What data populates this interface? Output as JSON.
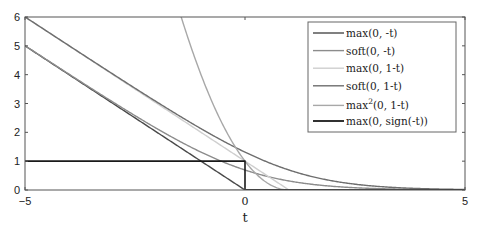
{
  "chart_data": {
    "type": "line",
    "title": "",
    "xlabel": "t",
    "ylabel": "",
    "xlim": [
      -5,
      5
    ],
    "ylim": [
      0,
      6
    ],
    "x_ticks": [
      -5,
      0,
      5
    ],
    "x_tick_labels": [
      "−5",
      "0",
      "5"
    ],
    "y_ticks": [
      0,
      1,
      2,
      3,
      4,
      5,
      6
    ],
    "y_tick_labels": [
      "0",
      "1",
      "2",
      "3",
      "4",
      "5",
      "6"
    ],
    "grid": false,
    "legend_position": "top-right",
    "series": [
      {
        "name": "max(0, -t)",
        "legend_base": "max",
        "legend_sup": "",
        "legend_args": "(0, -t)",
        "color": "#4a4a4a",
        "function": "max(0,-t)",
        "x": [
          -5,
          0,
          5
        ],
        "y": [
          5,
          0,
          0
        ]
      },
      {
        "name": "soft(0, -t)",
        "legend_base": "soft",
        "legend_sup": "",
        "legend_args": "(0, -t)",
        "color": "#8c8c8c",
        "function": "log(1+exp(-t))",
        "x": [
          -5,
          -2,
          -1,
          0,
          1,
          2,
          5
        ],
        "y": [
          5.007,
          2.127,
          1.313,
          0.693,
          0.313,
          0.127,
          0.007
        ]
      },
      {
        "name": "max(0, 1-t)",
        "legend_base": "max",
        "legend_sup": "",
        "legend_args": "(0, 1-t)",
        "color": "#cfcfcf",
        "function": "max(0,1-t)",
        "x": [
          -5,
          1,
          5
        ],
        "y": [
          6,
          0,
          0
        ]
      },
      {
        "name": "soft(0, 1-t)",
        "legend_base": "soft",
        "legend_sup": "",
        "legend_args": "(0, 1-t)",
        "color": "#6e6e6e",
        "function": "log(1+exp(1-t))",
        "x": [
          -5,
          -1,
          0,
          1,
          2,
          3,
          5
        ],
        "y": [
          6.002,
          2.127,
          1.313,
          0.693,
          0.313,
          0.127,
          0.018
        ]
      },
      {
        "name": "max^2(0, 1-t)",
        "legend_base": "max",
        "legend_sup": "2",
        "legend_args": "(0, 1-t)",
        "color": "#a8a8a8",
        "function": "max(0,1-t)^2",
        "x": [
          -1.45,
          -1,
          0,
          0.5,
          1,
          5
        ],
        "y": [
          6,
          4,
          1,
          0.25,
          0,
          0
        ]
      },
      {
        "name": "max(0, sign(-t))",
        "legend_base": "max",
        "legend_sup": "",
        "legend_args": "(0, sign(-t))",
        "color": "#1a1a1a",
        "function": "max(0,sign(-t))",
        "x": [
          -5,
          0,
          0,
          5
        ],
        "y": [
          1,
          1,
          0,
          0
        ]
      }
    ]
  }
}
